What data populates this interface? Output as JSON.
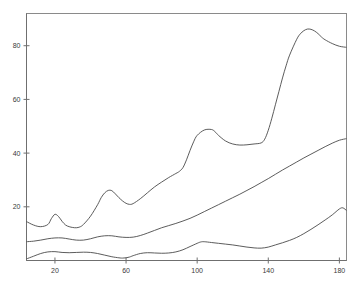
{
  "chart_data": {
    "type": "line",
    "title": "",
    "subtitle": "",
    "xlabel": "",
    "ylabel": "",
    "xlim": [
      4,
      184
    ],
    "ylim": [
      0,
      92
    ],
    "grid": false,
    "legend": "none",
    "background_color": "#ffffff",
    "line_color": "#4a4a4a",
    "axis_color": "#6f6f6f",
    "frame_color": "#8a8a8a",
    "xticks": [
      20,
      60,
      100,
      140,
      180
    ],
    "xticklabels": [
      "20",
      "60",
      "100",
      "140",
      "180"
    ],
    "yticks": [
      20,
      40,
      60,
      80
    ],
    "yticklabels": [
      "20",
      "40",
      "60",
      "80"
    ],
    "series": [
      {
        "name": "upper",
        "x": [
          4,
          8,
          12,
          16,
          18,
          20,
          22,
          24,
          26,
          28,
          30,
          32,
          34,
          36,
          40,
          44,
          46,
          48,
          50,
          52,
          54,
          56,
          58,
          60,
          62,
          64,
          68,
          72,
          76,
          80,
          84,
          88,
          90,
          92,
          94,
          96,
          98,
          100,
          104,
          108,
          110,
          112,
          116,
          120,
          124,
          128,
          132,
          136,
          138,
          140,
          142,
          144,
          146,
          148,
          150,
          152,
          156,
          158,
          160,
          162,
          164,
          166,
          168,
          170,
          172,
          176,
          180,
          184
        ],
        "y": [
          14.5,
          13.2,
          12.6,
          13.4,
          15.6,
          17.2,
          16.4,
          14.6,
          13.2,
          12.6,
          12.3,
          12.2,
          12.5,
          13.4,
          16.5,
          20.8,
          23.4,
          25.2,
          26.1,
          26.0,
          24.8,
          23.4,
          22.2,
          21.3,
          20.9,
          21.2,
          23.0,
          25.2,
          27.4,
          29.2,
          30.9,
          32.4,
          33.2,
          34.6,
          37.5,
          41.0,
          44.2,
          46.6,
          48.6,
          48.8,
          48.0,
          46.6,
          44.5,
          43.4,
          43.0,
          43.1,
          43.4,
          43.8,
          45.2,
          48.5,
          53.0,
          58.0,
          63.0,
          68.0,
          72.5,
          76.5,
          82.4,
          84.4,
          85.6,
          86.2,
          86.1,
          85.5,
          84.5,
          83.2,
          82.2,
          80.8,
          79.8,
          79.4
        ]
      },
      {
        "name": "middle",
        "x": [
          4,
          8,
          12,
          16,
          20,
          24,
          28,
          32,
          36,
          40,
          44,
          48,
          52,
          56,
          60,
          64,
          68,
          72,
          76,
          80,
          84,
          88,
          92,
          96,
          100,
          104,
          108,
          112,
          116,
          120,
          124,
          128,
          132,
          136,
          140,
          144,
          148,
          152,
          156,
          160,
          164,
          168,
          172,
          176,
          180,
          184
        ],
        "y": [
          7.0,
          7.2,
          7.6,
          8.1,
          8.4,
          8.4,
          8.0,
          7.6,
          7.6,
          8.1,
          8.8,
          9.2,
          9.2,
          8.8,
          8.6,
          8.7,
          9.3,
          10.2,
          11.2,
          12.2,
          13.0,
          13.8,
          14.7,
          15.7,
          16.9,
          18.2,
          19.5,
          20.8,
          22.1,
          23.4,
          24.7,
          26.1,
          27.5,
          29.0,
          30.5,
          32.1,
          33.7,
          35.2,
          36.7,
          38.2,
          39.6,
          41.0,
          42.4,
          43.7,
          44.8,
          45.4
        ]
      },
      {
        "name": "lower",
        "x": [
          4,
          8,
          12,
          16,
          20,
          24,
          28,
          32,
          36,
          40,
          44,
          48,
          52,
          56,
          58,
          60,
          62,
          64,
          68,
          72,
          76,
          80,
          84,
          88,
          92,
          96,
          100,
          102,
          104,
          108,
          112,
          116,
          120,
          124,
          128,
          132,
          136,
          140,
          144,
          148,
          152,
          156,
          160,
          164,
          168,
          172,
          176,
          180,
          182,
          184
        ],
        "y": [
          0.6,
          1.6,
          2.6,
          3.2,
          3.3,
          3.0,
          2.9,
          3.0,
          3.1,
          3.0,
          2.6,
          2.0,
          1.4,
          1.0,
          0.9,
          1.0,
          1.3,
          1.8,
          2.6,
          2.9,
          2.8,
          2.7,
          2.8,
          3.2,
          4.0,
          5.2,
          6.4,
          6.9,
          7.0,
          6.7,
          6.4,
          6.1,
          5.8,
          5.4,
          5.0,
          4.7,
          4.6,
          5.0,
          5.8,
          6.6,
          7.5,
          8.6,
          10.0,
          11.6,
          13.3,
          15.1,
          17.0,
          19.2,
          19.6,
          18.6
        ]
      }
    ]
  }
}
